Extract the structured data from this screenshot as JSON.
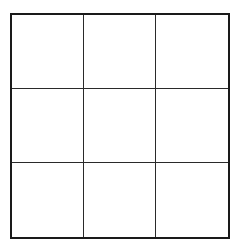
{
  "board": {
    "rows": 3,
    "cols": 3,
    "cells": [
      [
        "",
        "",
        ""
      ],
      [
        "",
        "",
        ""
      ],
      [
        "",
        "",
        ""
      ]
    ],
    "line_color": "#1a1a1a",
    "background": "#ffffff"
  }
}
